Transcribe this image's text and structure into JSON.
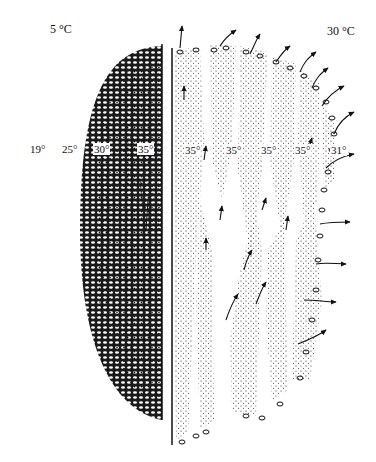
{
  "figure": {
    "left_panel": {
      "temperature_label": "5 °C",
      "zone_labels": [
        "19°",
        "25°",
        "30°",
        "35°"
      ]
    },
    "right_panel": {
      "temperature_label": "30 °C",
      "zone_labels": [
        "35°",
        "35°",
        "35°",
        "35°",
        "31°"
      ]
    },
    "colors": {
      "ink": "#111111",
      "background": "#ffffff"
    }
  }
}
